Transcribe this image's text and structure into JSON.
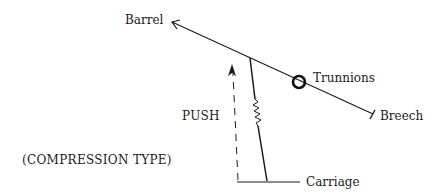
{
  "diagram": {
    "labels": {
      "barrel": "Barrel",
      "trunnions": "Trunnions",
      "breech": "Breech",
      "push": "PUSH",
      "compression_type": "(COMPRESSION TYPE)",
      "carriage": "Carriage"
    },
    "colors": {
      "line": "#1a1a1a",
      "background": "#ffffff"
    }
  }
}
